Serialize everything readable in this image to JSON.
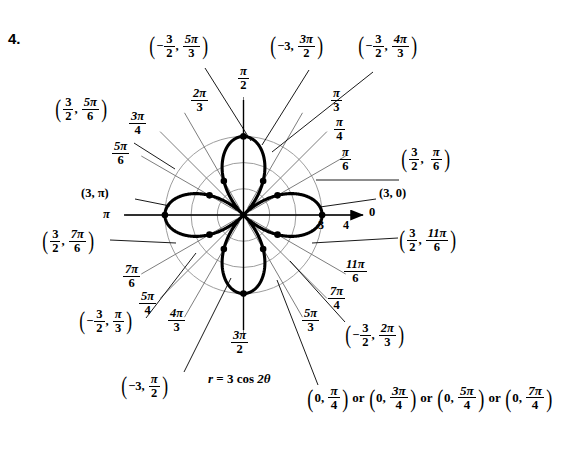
{
  "problem": {
    "number": "4."
  },
  "equation": {
    "label": "r = 3 cos 2θ",
    "r_symbol": "r",
    "eq": "=",
    "amplitude": "3",
    "fn": "cos",
    "arg": "2θ"
  },
  "axis_ticks": {
    "three": "3",
    "four": "4",
    "zero": "0"
  },
  "angle_labels": [
    {
      "name": "pi-over-2",
      "num": "π",
      "den": "2",
      "deg": 90
    },
    {
      "name": "pi-over-3",
      "num": "π",
      "den": "3",
      "deg": 60
    },
    {
      "name": "pi-over-4",
      "num": "π",
      "den": "4",
      "deg": 45
    },
    {
      "name": "pi-over-6",
      "num": "π",
      "den": "6",
      "deg": 30
    },
    {
      "name": "zero",
      "num": "0",
      "den": "",
      "deg": 0
    },
    {
      "name": "two-pi-over-3",
      "num": "2π",
      "den": "3",
      "deg": 120
    },
    {
      "name": "three-pi-over-4",
      "num": "3π",
      "den": "4",
      "deg": 135
    },
    {
      "name": "five-pi-over-6",
      "num": "5π",
      "den": "6",
      "deg": 150
    },
    {
      "name": "pi",
      "num": "π",
      "den": "",
      "deg": 180
    },
    {
      "name": "seven-pi-over-6",
      "num": "7π",
      "den": "6",
      "deg": 210
    },
    {
      "name": "five-pi-over-4",
      "num": "5π",
      "den": "4",
      "deg": 225
    },
    {
      "name": "four-pi-over-3",
      "num": "4π",
      "den": "3",
      "deg": 240
    },
    {
      "name": "three-pi-over-2",
      "num": "3π",
      "den": "2",
      "deg": 270
    },
    {
      "name": "five-pi-over-3",
      "num": "5π",
      "den": "3",
      "deg": 300
    },
    {
      "name": "seven-pi-over-4",
      "num": "7π",
      "den": "4",
      "deg": 315
    },
    {
      "name": "eleven-pi-over-6",
      "num": "11π",
      "den": "6",
      "deg": 330
    }
  ],
  "point_labels": [
    {
      "name": "pt-neg-3halves-5pi3",
      "r": "−",
      "rnum": "3",
      "rden": "2",
      "tnum": "5π",
      "tden": "3",
      "plain_r": "",
      "text": "(−3/2, 5π/3)"
    },
    {
      "name": "pt-neg3-3pi2",
      "r": "−3",
      "rnum": "",
      "rden": "",
      "tnum": "3π",
      "tden": "2",
      "plain_r": "−3",
      "text": "(−3, 3π/2)"
    },
    {
      "name": "pt-neg-3halves-4pi3",
      "r": "−",
      "rnum": "3",
      "rden": "2",
      "tnum": "4π",
      "tden": "3",
      "plain_r": "",
      "text": "(−3/2, 4π/3)"
    },
    {
      "name": "pt-3halves-5pi6",
      "r": "",
      "rnum": "3",
      "rden": "2",
      "tnum": "5π",
      "tden": "6",
      "plain_r": "",
      "text": "(3/2, 5π/6)"
    },
    {
      "name": "pt-3halves-pi6",
      "r": "",
      "rnum": "3",
      "rden": "2",
      "tnum": "π",
      "tden": "6",
      "plain_r": "",
      "text": "(3/2, π/6)"
    },
    {
      "name": "pt-3-pi",
      "r": "",
      "rnum": "",
      "rden": "",
      "tnum": "",
      "tden": "",
      "plain_r": "3",
      "text": "(3, π)"
    },
    {
      "name": "pt-3-0",
      "r": "",
      "rnum": "",
      "rden": "",
      "tnum": "",
      "tden": "",
      "plain_r": "3",
      "text": "(3, 0)"
    },
    {
      "name": "pt-3halves-7pi6",
      "r": "",
      "rnum": "3",
      "rden": "2",
      "tnum": "7π",
      "tden": "6",
      "plain_r": "",
      "text": "(3/2, 7π/6)"
    },
    {
      "name": "pt-3halves-11pi6",
      "r": "",
      "rnum": "3",
      "rden": "2",
      "tnum": "11π",
      "tden": "6",
      "plain_r": "",
      "text": "(3/2, 11π/6)"
    },
    {
      "name": "pt-neg-3halves-pi3",
      "r": "−",
      "rnum": "3",
      "rden": "2",
      "tnum": "π",
      "tden": "3",
      "plain_r": "",
      "text": "(−3/2, π/3)"
    },
    {
      "name": "pt-neg-3halves-2pi3",
      "r": "−",
      "rnum": "3",
      "rden": "2",
      "tnum": "2π",
      "tden": "3",
      "plain_r": "",
      "text": "(−3/2, 2π/3)"
    },
    {
      "name": "pt-neg3-pi2",
      "r": "−3",
      "rnum": "",
      "rden": "",
      "tnum": "π",
      "tden": "2",
      "plain_r": "−3",
      "text": "(−3, π/2)"
    }
  ],
  "labels": {
    "p_neg32_5pi3": {
      "sign": "−",
      "rn": "3",
      "rd": "2",
      "tn": "5π",
      "td": "3"
    },
    "p_neg3_3pi2": {
      "r": "−3",
      "tn": "3π",
      "td": "2"
    },
    "p_neg32_4pi3": {
      "sign": "−",
      "rn": "3",
      "rd": "2",
      "tn": "4π",
      "td": "3"
    },
    "p_32_5pi6": {
      "rn": "3",
      "rd": "2",
      "tn": "5π",
      "td": "6"
    },
    "p_32_pi6": {
      "rn": "3",
      "rd": "2",
      "tn": "π",
      "td": "6"
    },
    "p_3_pi": {
      "text": "(3, π)"
    },
    "p_3_0": {
      "text": "(3, 0)"
    },
    "p_32_7pi6": {
      "rn": "3",
      "rd": "2",
      "tn": "7π",
      "td": "6"
    },
    "p_32_11pi6": {
      "rn": "3",
      "rd": "2",
      "tn": "11π",
      "td": "6"
    },
    "p_neg32_pi3": {
      "sign": "−",
      "rn": "3",
      "rd": "2",
      "tn": "π",
      "td": "3"
    },
    "p_neg32_2pi3": {
      "sign": "−",
      "rn": "3",
      "rd": "2",
      "tn": "2π",
      "td": "3"
    },
    "p_neg3_pi2": {
      "r": "−3",
      "tn": "π",
      "td": "2"
    }
  },
  "pole_points": {
    "or1": "or",
    "or2": "or",
    "or3": "or",
    "z1": {
      "r": "0",
      "tn": "π",
      "td": "4"
    },
    "z2": {
      "r": "0",
      "tn": "3π",
      "td": "4"
    },
    "z3": {
      "r": "0",
      "tn": "5π",
      "td": "4"
    },
    "z4": {
      "r": "0",
      "tn": "7π",
      "td": "4"
    }
  },
  "chart_data": {
    "type": "line",
    "subtype": "polar-rose",
    "equation": "r = 3 cos 2θ",
    "polar": true,
    "petals": 4,
    "max_r": 3,
    "grid": {
      "circles_r": [
        1,
        2,
        3
      ],
      "radial_spokes_deg": [
        0,
        30,
        45,
        60,
        90,
        120,
        135,
        150,
        180,
        210,
        225,
        240,
        270,
        300,
        315,
        330
      ],
      "axis_arrow_to_r": 4.6
    },
    "axis_ticks_r": [
      3,
      4
    ],
    "theta_tick_labels": [
      "0",
      "π/6",
      "π/4",
      "π/3",
      "π/2",
      "2π/3",
      "3π/4",
      "5π/6",
      "π",
      "7π/6",
      "5π/4",
      "4π/3",
      "3π/2",
      "5π/3",
      "7π/4",
      "11π/6"
    ],
    "marked_points": [
      {
        "r": 3,
        "theta": "0",
        "theta_deg": 0,
        "label": "(3, 0)"
      },
      {
        "r": 1.5,
        "theta": "π/6",
        "theta_deg": 30,
        "label": "(3/2, π/6)"
      },
      {
        "r": -1.5,
        "theta": "π/3",
        "theta_deg": 60,
        "label": "(−3/2, π/3)"
      },
      {
        "r": -3,
        "theta": "π/2",
        "theta_deg": 90,
        "label": "(−3, π/2)"
      },
      {
        "r": -1.5,
        "theta": "2π/3",
        "theta_deg": 120,
        "label": "(−3/2, 2π/3)"
      },
      {
        "r": 1.5,
        "theta": "5π/6",
        "theta_deg": 150,
        "label": "(3/2, 5π/6)"
      },
      {
        "r": 3,
        "theta": "π",
        "theta_deg": 180,
        "label": "(3, π)"
      },
      {
        "r": 1.5,
        "theta": "7π/6",
        "theta_deg": 210,
        "label": "(3/2, 7π/6)"
      },
      {
        "r": -1.5,
        "theta": "4π/3",
        "theta_deg": 240,
        "label": "(−3/2, 4π/3)"
      },
      {
        "r": -3,
        "theta": "3π/2",
        "theta_deg": 270,
        "label": "(−3, 3π/2)"
      },
      {
        "r": -1.5,
        "theta": "5π/3",
        "theta_deg": 300,
        "label": "(−3/2, 5π/3)"
      },
      {
        "r": 1.5,
        "theta": "11π/6",
        "theta_deg": 330,
        "label": "(3/2, 11π/6)"
      },
      {
        "r": 0,
        "theta": "π/4",
        "theta_deg": 45,
        "label": "(0, π/4)"
      },
      {
        "r": 0,
        "theta": "3π/4",
        "theta_deg": 135,
        "label": "(0, 3π/4)"
      },
      {
        "r": 0,
        "theta": "5π/4",
        "theta_deg": 225,
        "label": "(0, 5π/4)"
      },
      {
        "r": 0,
        "theta": "7π/4",
        "theta_deg": 315,
        "label": "(0, 7π/4)"
      }
    ]
  },
  "colors": {
    "curve": "#000000",
    "grid": "#9a9a9a",
    "spoke": "#5a5a5a",
    "axis": "#000000",
    "background": "#ffffff"
  }
}
